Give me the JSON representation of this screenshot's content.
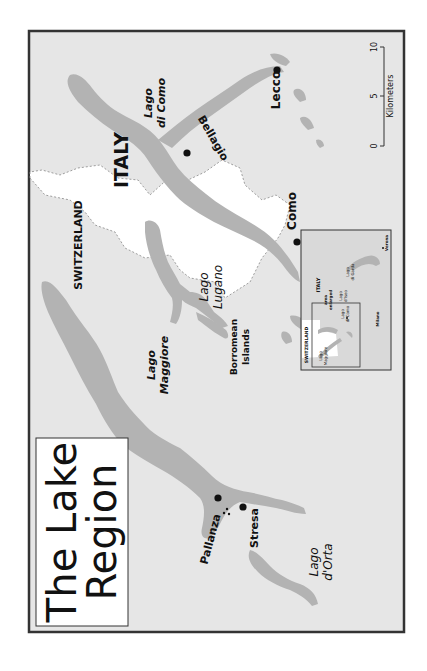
{
  "map": {
    "title_line1": "The Lake",
    "title_line2": "Region",
    "orientation": "rotated 90° counter-clockwise (text reads bottom-to-top)",
    "colors": {
      "land": "#e6e6e6",
      "water": "#b3b3b3",
      "switzerland": "#ffffff",
      "frame": "#333333",
      "border_dash": "#888888",
      "text": "#111111"
    },
    "countries": {
      "switzerland": "SWITZERLAND",
      "italy": "ITALY"
    },
    "lakes": {
      "maggiore_l1": "Lago",
      "maggiore_l2": "Maggiore",
      "lugano_l1": "Lago",
      "lugano_l2": "Lugano",
      "como_l1": "Lago",
      "como_l2": "di Como",
      "orta_l1": "Lago",
      "orta_l2": "d'Orta"
    },
    "islands": {
      "borromean_l1": "Borromean",
      "borromean_l2": "Islands"
    },
    "towns": {
      "pallanza": "Pallanza",
      "stresa": "Stresa",
      "como": "Como",
      "bellagio": "Bellagio",
      "lecco": "Lecco"
    },
    "scale_bar": {
      "unit": "Kilometers",
      "ticks": [
        "0",
        "5",
        "10"
      ]
    },
    "inset": {
      "switzerland": "SWITZERLAND",
      "italy": "ITALY",
      "area_l1": "area",
      "area_l2": "enlarged",
      "maggiore_l1": "Lago",
      "maggiore_l2": "Maggiore",
      "como_l1": "Lago",
      "como_l2": "di Como",
      "iseo_l1": "Lago",
      "iseo_l2": "d'Iseo",
      "garda_l1": "Lago",
      "garda_l2": "di Garda",
      "milano": "Milano",
      "verona": "Verona"
    }
  }
}
